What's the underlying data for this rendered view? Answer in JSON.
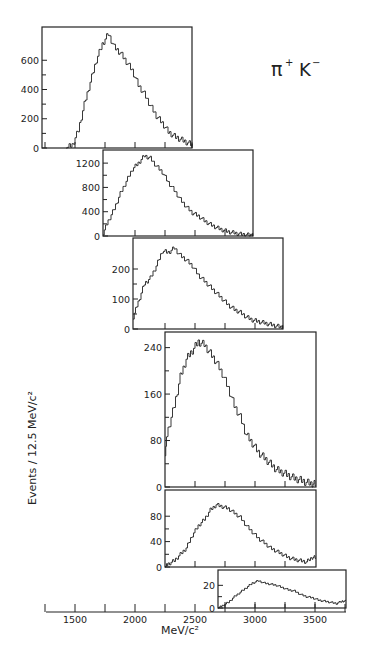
{
  "figure": {
    "title_main": "π",
    "title_sup1": "+",
    "title_k": "K",
    "title_sup2": "−",
    "ylabel": "Events / 12.5  MeV/c²",
    "xlabel": "MeV/c²",
    "ink_color": "#222222",
    "background": "#ffffff"
  },
  "chart_data": {
    "type": "line",
    "style": "step-histogram, stacked offset panels",
    "xlabel": "MeV/c²",
    "ylabel": "Events / 12.5 MeV/c²",
    "xlim": [
      1250,
      3750
    ],
    "x_ticks": [
      1500,
      2000,
      2500,
      3000,
      3500
    ],
    "x_tick_labels": [
      "1500",
      "2000",
      "2500",
      "3000",
      "3500"
    ],
    "bin_width_mev": 12.5,
    "grid": false,
    "panels": [
      {
        "name": "panel-1",
        "x_range": [
          1250,
          2500
        ],
        "y_ticks": [
          0,
          200,
          400,
          600
        ],
        "ylim": [
          0,
          800
        ],
        "x": [
          1450,
          1500,
          1550,
          1600,
          1650,
          1700,
          1750,
          1800,
          1850,
          1900,
          1950,
          2000,
          2050,
          2100,
          2150,
          2200,
          2250,
          2300,
          2350,
          2400,
          2450,
          2500
        ],
        "values": [
          0,
          20,
          120,
          300,
          450,
          600,
          710,
          780,
          690,
          650,
          590,
          530,
          430,
          370,
          290,
          220,
          170,
          110,
          80,
          60,
          40,
          20
        ]
      },
      {
        "name": "panel-2",
        "x_range": [
          1750,
          3000
        ],
        "y_ticks": [
          0,
          400,
          800,
          1200
        ],
        "ylim": [
          0,
          1350
        ],
        "x": [
          1750,
          1800,
          1850,
          1900,
          1950,
          2000,
          2050,
          2100,
          2150,
          2200,
          2250,
          2300,
          2350,
          2400,
          2450,
          2500,
          2550,
          2600,
          2650,
          2700,
          2750,
          2800,
          2850,
          2900,
          2950,
          3000
        ],
        "values": [
          50,
          250,
          450,
          700,
          900,
          1100,
          1200,
          1320,
          1280,
          1150,
          1050,
          880,
          750,
          600,
          480,
          380,
          330,
          250,
          190,
          140,
          100,
          70,
          50,
          30,
          20,
          10
        ]
      },
      {
        "name": "panel-3",
        "x_range": [
          2000,
          3250
        ],
        "y_ticks": [
          0,
          100,
          200
        ],
        "ylim": [
          0,
          290
        ],
        "x": [
          2000,
          2050,
          2100,
          2150,
          2200,
          2250,
          2300,
          2350,
          2400,
          2450,
          2500,
          2550,
          2600,
          2650,
          2700,
          2750,
          2800,
          2850,
          2900,
          2950,
          3000,
          3050,
          3100,
          3150,
          3200,
          3250
        ],
        "values": [
          40,
          90,
          150,
          170,
          210,
          260,
          255,
          270,
          245,
          230,
          210,
          180,
          160,
          140,
          120,
          100,
          80,
          65,
          55,
          40,
          30,
          25,
          20,
          15,
          10,
          5
        ]
      },
      {
        "name": "panel-4",
        "x_range": [
          2250,
          3500
        ],
        "y_ticks": [
          0,
          80,
          160,
          240
        ],
        "ylim": [
          0,
          260
        ],
        "x": [
          2250,
          2300,
          2350,
          2400,
          2450,
          2500,
          2550,
          2600,
          2650,
          2700,
          2750,
          2800,
          2850,
          2900,
          2950,
          3000,
          3050,
          3100,
          3150,
          3200,
          3250,
          3300,
          3350,
          3400,
          3450,
          3500
        ],
        "values": [
          60,
          100,
          140,
          190,
          220,
          235,
          250,
          245,
          230,
          215,
          195,
          170,
          140,
          120,
          90,
          75,
          60,
          50,
          40,
          30,
          25,
          20,
          15,
          12,
          8,
          5
        ]
      },
      {
        "name": "panel-5",
        "x_range": [
          2250,
          3500
        ],
        "y_ticks": [
          0,
          40,
          80
        ],
        "ylim": [
          0,
          115
        ],
        "x": [
          2250,
          2300,
          2350,
          2400,
          2450,
          2500,
          2550,
          2600,
          2650,
          2700,
          2750,
          2800,
          2850,
          2900,
          2950,
          3000,
          3050,
          3100,
          3150,
          3200,
          3250,
          3300,
          3350,
          3400,
          3450,
          3500
        ],
        "values": [
          0,
          5,
          10,
          20,
          30,
          50,
          65,
          75,
          90,
          98,
          95,
          92,
          85,
          78,
          65,
          55,
          45,
          38,
          30,
          25,
          20,
          15,
          12,
          10,
          8,
          15
        ]
      },
      {
        "name": "panel-6",
        "x_range": [
          2700,
          3750
        ],
        "y_ticks": [
          0,
          20
        ],
        "ylim": [
          0,
          30
        ],
        "x": [
          2700,
          2750,
          2800,
          2850,
          2900,
          2950,
          3000,
          3050,
          3100,
          3150,
          3200,
          3250,
          3300,
          3350,
          3400,
          3450,
          3500,
          3550,
          3600,
          3650,
          3700,
          3750
        ],
        "values": [
          0,
          2,
          5,
          10,
          14,
          18,
          22,
          24,
          22,
          21,
          20,
          18,
          16,
          15,
          12,
          10,
          9,
          7,
          6,
          5,
          4,
          6
        ]
      }
    ],
    "annotations": [
      "π⁺ K⁻"
    ]
  }
}
